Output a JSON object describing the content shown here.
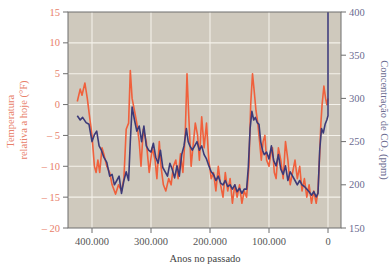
{
  "chart_data": {
    "type": "line",
    "title": "",
    "xlabel": "Anos no passado",
    "ylabel_left": "Temperatura relativa a hoje (°F)",
    "ylabel_right": "Concentração de CO₂ (ppm)",
    "x_ticks": [
      {
        "value": 400000,
        "label": "400.000"
      },
      {
        "value": 300000,
        "label": "300.000"
      },
      {
        "value": 200000,
        "label": "200.000"
      },
      {
        "value": 100000,
        "label": "100.000"
      },
      {
        "value": 0,
        "label": "0"
      }
    ],
    "y_left_ticks": [
      15,
      10,
      5,
      0,
      -5,
      -10,
      -15,
      -20
    ],
    "y_left_tick_labels": [
      "15",
      "10",
      "5",
      "0",
      "– 5",
      "– 10",
      "– 15",
      "– 20"
    ],
    "y_right_ticks": [
      400,
      350,
      300,
      250,
      200,
      150
    ],
    "ylim_left": [
      -20,
      15
    ],
    "ylim_right": [
      150,
      400
    ],
    "xlim": [
      430000,
      -20000
    ],
    "x_reversed": true,
    "grid": true,
    "legend": "none (axis labels colored to match series)",
    "colors": {
      "background": "#cfc9bd",
      "grid": "#f4f1ea",
      "frame": "#6e6e6e",
      "temperature": "#f0603c",
      "co2": "#3c3a78",
      "left_axis_text": "#e8806a",
      "right_axis_text": "#6b6b90"
    },
    "series": [
      {
        "name": "Temperatura relativa a hoje (°F)",
        "axis": "left",
        "color": "#f0603c",
        "x_kyr_ago": [
          425,
          420,
          417,
          412,
          408,
          404,
          400,
          396,
          393,
          390,
          387,
          383,
          380,
          375,
          370,
          366,
          360,
          355,
          350,
          346,
          342,
          338,
          335,
          332,
          328,
          324,
          320,
          317,
          313,
          308,
          303,
          298,
          293,
          290,
          286,
          283,
          279,
          275,
          270,
          266,
          262,
          258,
          254,
          250,
          246,
          242,
          239,
          236,
          232,
          228,
          225,
          221,
          218,
          214,
          210,
          206,
          202,
          198,
          194,
          190,
          186,
          182,
          178,
          174,
          170,
          166,
          162,
          158,
          154,
          150,
          146,
          142,
          138,
          134,
          131,
          128,
          125,
          122,
          119,
          116,
          113,
          110,
          107,
          104,
          100,
          97,
          94,
          91,
          88,
          84,
          80,
          76,
          72,
          68,
          64,
          60,
          56,
          52,
          48,
          44,
          40,
          36,
          32,
          28,
          24,
          20,
          17,
          14,
          12,
          10,
          7,
          4,
          2,
          0
        ],
        "values": [
          0.5,
          2.5,
          1.5,
          3.5,
          1,
          -2,
          -5,
          -10,
          -11,
          -9,
          -11,
          -7,
          -8,
          -10,
          -11,
          -13,
          -14.5,
          -13,
          -14,
          -12,
          -4,
          -3,
          5.5,
          1,
          -1,
          -3,
          -6,
          -10,
          -4,
          -6,
          -11,
          -7,
          -9,
          -12,
          -6,
          -10,
          -13,
          -14,
          -12,
          -13,
          -10,
          -9,
          -12,
          -8,
          -11,
          -5,
          5,
          -2,
          -10,
          -6,
          -3,
          -5,
          -9,
          -2,
          -7,
          -3,
          -9,
          -12,
          -11,
          -14,
          -10,
          -13,
          -15,
          -11,
          -14,
          -12,
          -16,
          -13,
          -15,
          -13,
          -16,
          -14,
          -15,
          -10,
          0,
          5,
          2,
          -1,
          -3,
          -6,
          -9,
          -6,
          -5,
          -9,
          -10,
          -8,
          -7,
          -11,
          -12,
          -7,
          -9,
          -12,
          -6,
          -9,
          -13,
          -11,
          -9,
          -12,
          -10,
          -14,
          -12,
          -15,
          -13,
          -16,
          -14,
          -16,
          -14,
          -8,
          -3,
          0,
          3,
          1,
          0,
          1
        ]
      },
      {
        "name": "Concentração de CO₂ (ppm)",
        "axis": "right",
        "color": "#3c3a78",
        "x_kyr_ago": [
          425,
          420,
          416,
          410,
          405,
          400,
          396,
          392,
          388,
          384,
          380,
          375,
          370,
          366,
          362,
          358,
          354,
          350,
          346,
          342,
          338,
          335,
          332,
          328,
          324,
          320,
          316,
          312,
          308,
          304,
          300,
          296,
          292,
          288,
          284,
          280,
          276,
          272,
          268,
          264,
          260,
          256,
          252,
          248,
          244,
          240,
          237,
          234,
          230,
          226,
          222,
          218,
          214,
          210,
          206,
          202,
          198,
          194,
          190,
          186,
          182,
          178,
          174,
          170,
          166,
          162,
          158,
          154,
          150,
          146,
          142,
          138,
          135,
          132,
          129,
          126,
          123,
          120,
          117,
          114,
          111,
          108,
          104,
          100,
          96,
          92,
          88,
          84,
          80,
          76,
          72,
          68,
          64,
          60,
          56,
          52,
          48,
          44,
          40,
          36,
          32,
          28,
          24,
          20,
          17,
          14,
          11,
          8,
          5,
          2,
          0,
          0
        ],
        "values": [
          280,
          275,
          278,
          272,
          270,
          250,
          258,
          262,
          245,
          240,
          232,
          226,
          210,
          212,
          200,
          205,
          210,
          190,
          205,
          215,
          205,
          250,
          290,
          275,
          262,
          268,
          250,
          268,
          245,
          240,
          238,
          248,
          232,
          225,
          240,
          220,
          215,
          210,
          225,
          218,
          208,
          222,
          210,
          235,
          245,
          265,
          250,
          245,
          240,
          245,
          250,
          240,
          245,
          235,
          230,
          222,
          215,
          212,
          205,
          210,
          202,
          200,
          205,
          198,
          200,
          195,
          200,
          192,
          196,
          190,
          195,
          195,
          220,
          265,
          285,
          275,
          278,
          272,
          270,
          250,
          240,
          235,
          238,
          230,
          245,
          228,
          222,
          235,
          218,
          212,
          222,
          205,
          215,
          210,
          205,
          200,
          205,
          200,
          198,
          195,
          192,
          188,
          192,
          186,
          190,
          240,
          265,
          260,
          270,
          275,
          280,
          400
        ]
      }
    ]
  }
}
